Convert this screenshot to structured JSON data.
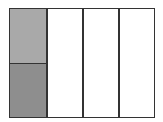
{
  "diagram": {
    "type": "fraction-model",
    "columns": 4,
    "first_column_rows": 2,
    "shaded": [
      {
        "column": 1,
        "row": 1,
        "color": "#a9a9a9"
      },
      {
        "column": 1,
        "row": 2,
        "color": "#8e8e8e"
      }
    ],
    "colors": {
      "border": "#333333",
      "unshaded": "#ffffff"
    }
  }
}
